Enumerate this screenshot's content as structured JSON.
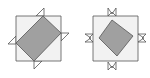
{
  "figures": [
    {
      "name": "tilted-square-figure",
      "light_square": [
        [
          16,
          16
        ],
        [
          61,
          16
        ],
        [
          61,
          61
        ],
        [
          16,
          61
        ]
      ],
      "dark_square": [
        [
          43,
          16
        ],
        [
          61,
          33
        ],
        [
          34,
          61
        ],
        [
          16,
          43
        ]
      ],
      "flags": [
        [
          [
            36,
            16
          ],
          [
            44,
            8
          ],
          [
            44,
            16
          ]
        ],
        [
          [
            16,
            36
          ],
          [
            8,
            44
          ],
          [
            16,
            44
          ]
        ],
        [
          [
            61,
            33
          ],
          [
            69,
            33
          ],
          [
            61,
            41
          ]
        ],
        [
          [
            34,
            61
          ],
          [
            34,
            69
          ],
          [
            42,
            61
          ]
        ]
      ]
    },
    {
      "name": "diamond-square-figure",
      "light_square": [
        [
          93,
          16
        ],
        [
          138,
          16
        ],
        [
          138,
          61
        ],
        [
          93,
          61
        ]
      ],
      "dark_square": [
        [
          112,
          20
        ],
        [
          133,
          36
        ],
        [
          117,
          56
        ],
        [
          99,
          38
        ]
      ],
      "bowties": [
        [
          [
            108,
            8
          ],
          [
            112,
            14
          ],
          [
            116,
            8
          ],
          [
            116,
            16
          ],
          [
            112,
            12
          ],
          [
            108,
            16
          ]
        ],
        [
          [
            108,
            62
          ],
          [
            112,
            68
          ],
          [
            116,
            62
          ],
          [
            116,
            70
          ],
          [
            112,
            66
          ],
          [
            108,
            70
          ]
        ],
        [
          [
            85,
            34
          ],
          [
            91,
            38
          ],
          [
            85,
            42
          ],
          [
            93,
            42
          ],
          [
            89,
            38
          ],
          [
            93,
            34
          ]
        ],
        [
          [
            138,
            34
          ],
          [
            144,
            38
          ],
          [
            138,
            42
          ],
          [
            146,
            42
          ],
          [
            142,
            38
          ],
          [
            146,
            34
          ]
        ]
      ]
    }
  ],
  "colors": {
    "light_fill": "#f2f2f2",
    "dark_fill": "#a0a0a0",
    "stroke": "#555555",
    "flag_fill": "#ffffff"
  }
}
